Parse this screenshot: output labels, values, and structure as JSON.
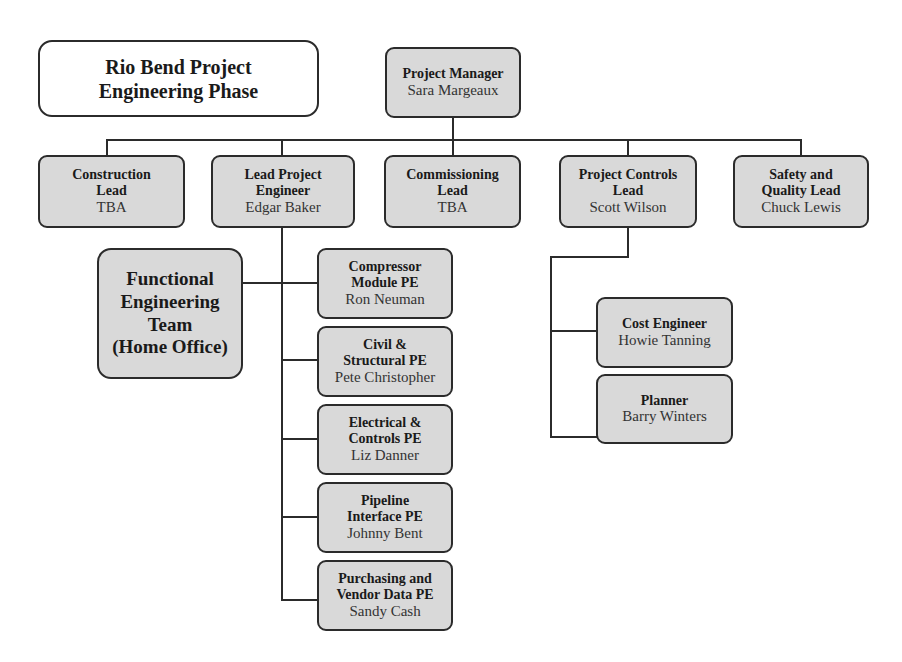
{
  "title": {
    "line1": "Rio Bend Project",
    "line2": "Engineering Phase"
  },
  "project_manager": {
    "role": "Project Manager",
    "name": "Sara Margeaux"
  },
  "leads": [
    {
      "role_line1": "Construction",
      "role_line2": "Lead",
      "name": "TBA"
    },
    {
      "role_line1": "Lead Project",
      "role_line2": "Engineer",
      "name": "Edgar Baker"
    },
    {
      "role_line1": "Commissioning",
      "role_line2": "Lead",
      "name": "TBA"
    },
    {
      "role_line1": "Project Controls",
      "role_line2": "Lead",
      "name": "Scott Wilson"
    },
    {
      "role_line1": "Safety and",
      "role_line2": "Quality Lead",
      "name": "Chuck Lewis"
    }
  ],
  "functional_team": {
    "line1": "Functional",
    "line2": "Engineering",
    "line3": "Team",
    "line4": "(Home Office)"
  },
  "project_engineers": [
    {
      "role_line1": "Compressor",
      "role_line2": "Module PE",
      "name": "Ron Neuman"
    },
    {
      "role_line1": "Civil &",
      "role_line2": "Structural PE",
      "name": "Pete Christopher"
    },
    {
      "role_line1": "Electrical &",
      "role_line2": "Controls PE",
      "name": "Liz Danner"
    },
    {
      "role_line1": "Pipeline",
      "role_line2": "Interface PE",
      "name": "Johnny Bent"
    },
    {
      "role_line1": "Purchasing and",
      "role_line2": "Vendor Data PE",
      "name": "Sandy Cash"
    }
  ],
  "project_controls_staff": [
    {
      "role": "Cost Engineer",
      "name": "Howie Tanning"
    },
    {
      "role": "Planner",
      "name": "Barry Winters"
    }
  ],
  "colors": {
    "box_fill": "#d9d9d9",
    "border": "#2b2b2b",
    "title_fill": "#ffffff"
  }
}
